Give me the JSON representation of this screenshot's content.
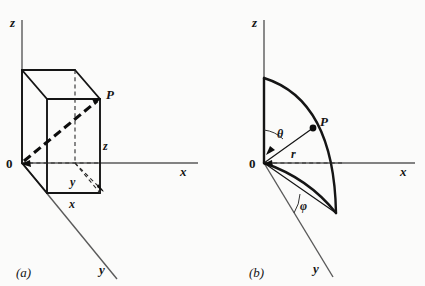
{
  "figure": {
    "title_a": "(a)",
    "title_b": "(b)",
    "background_color": "#fbfbfa",
    "ink_color": "#151515",
    "axis_color": "#5a5a5a"
  },
  "panel_a": {
    "caption": "(a)",
    "axis_z_label": "z",
    "axis_x_label": "x",
    "axis_y_label": "y",
    "origin_label": "0",
    "point_label": "P",
    "coord_z_label": "z",
    "coord_y_label": "y",
    "coord_x_label": "x"
  },
  "panel_b": {
    "caption": "(b)",
    "axis_z_label": "z",
    "axis_x_label": "x",
    "axis_y_label": "y",
    "origin_label": "0",
    "point_label": "P",
    "radius_label": "r",
    "polar_angle_label": "θ",
    "azimuth_angle_label": "φ"
  }
}
